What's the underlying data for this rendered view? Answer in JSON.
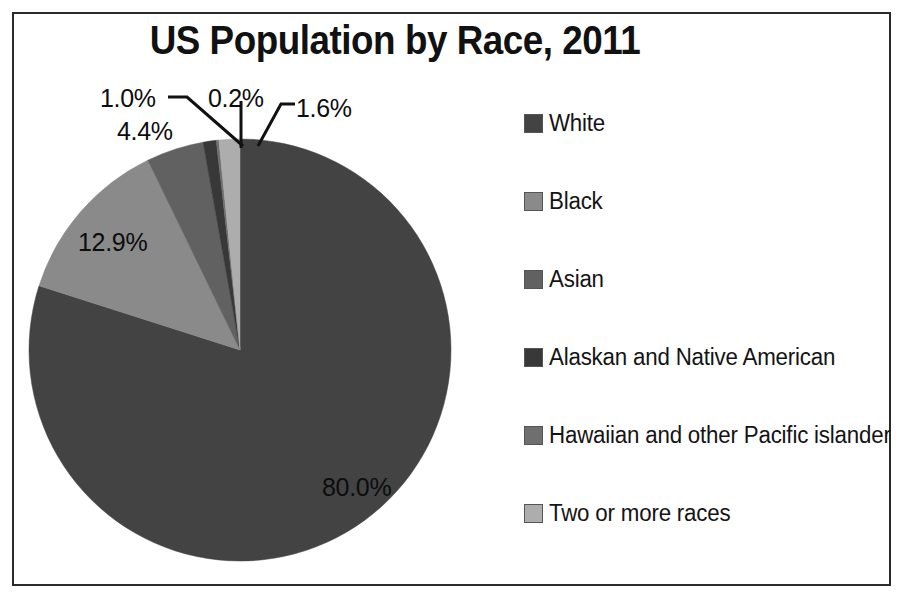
{
  "chart": {
    "title": "US Population by Race, 2011"
  },
  "chart_data": {
    "type": "pie",
    "title": "US Population by Race, 2011",
    "xlabel": "",
    "ylabel": "",
    "legend_position": "right",
    "grid": false,
    "units": "percent",
    "categories": [
      "White",
      "Black",
      "Asian",
      "Alaskan and Native American",
      "Hawaiian and other Pacific islander",
      "Two or more races"
    ],
    "values": [
      80.0,
      12.9,
      4.4,
      1.0,
      0.2,
      1.6
    ],
    "data_labels": [
      "80.0%",
      "12.9%",
      "4.4%",
      "1.0%",
      "0.2%",
      "1.6%"
    ],
    "colors": [
      "#434343",
      "#8a8a8a",
      "#616161",
      "#383838",
      "#6f6f6f",
      "#adadad"
    ],
    "slices": [
      {
        "label": "White",
        "value": 80.0,
        "display": "80.0%",
        "color": "#434343"
      },
      {
        "label": "Black",
        "value": 12.9,
        "display": "12.9%",
        "color": "#8a8a8a"
      },
      {
        "label": "Asian",
        "value": 4.4,
        "display": "4.4%",
        "color": "#616161"
      },
      {
        "label": "Alaskan and Native American",
        "value": 1.0,
        "display": "1.0%",
        "color": "#383838"
      },
      {
        "label": "Hawaiian and other Pacific islander",
        "value": 0.2,
        "display": "0.2%",
        "color": "#6f6f6f"
      },
      {
        "label": "Two or more races",
        "value": 1.6,
        "display": "1.6%",
        "color": "#adadad"
      }
    ]
  },
  "labels": {
    "white_pct": "80.0%",
    "black_pct": "12.9%",
    "asian_pct": "4.4%",
    "alaskan_pct": "1.0%",
    "hawaiian_pct": "0.2%",
    "two_or_more_pct": "1.6%"
  },
  "legend": {
    "items": [
      {
        "label": "White",
        "color": "#434343"
      },
      {
        "label": "Black",
        "color": "#8a8a8a"
      },
      {
        "label": "Asian",
        "color": "#616161"
      },
      {
        "label": "Alaskan and Native American",
        "color": "#383838"
      },
      {
        "label": "Hawaiian and other Pacific islander",
        "color": "#6f6f6f"
      },
      {
        "label": "Two or more races",
        "color": "#adadad"
      }
    ]
  }
}
